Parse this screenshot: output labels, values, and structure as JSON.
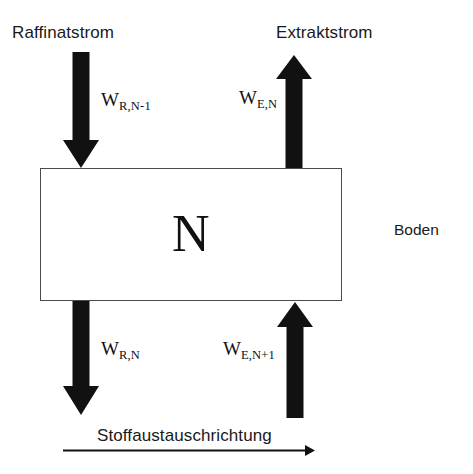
{
  "diagram": {
    "title_top_left": "Raffinatstrom",
    "title_top_right": "Extraktstrom",
    "side_label": "Boden",
    "stage_label": "N",
    "bottom_caption": "Stoffaustauschrichtung",
    "flux_labels": {
      "top_left": {
        "symbol": "W",
        "subscript": "R,N-1"
      },
      "top_right": {
        "symbol": "W",
        "subscript": "E,N"
      },
      "bottom_left": {
        "symbol": "W",
        "subscript": "R,N"
      },
      "bottom_right": {
        "symbol": "W",
        "subscript": "E,N+1"
      }
    },
    "colors": {
      "arrow_fill": "#111111",
      "box_stroke": "#4a4a4a",
      "text": "#1a1a1a",
      "background": "#ffffff"
    },
    "arrows": [
      {
        "name": "raffinat-in",
        "direction": "down",
        "position": "top-left"
      },
      {
        "name": "extrakt-out",
        "direction": "up",
        "position": "top-right"
      },
      {
        "name": "raffinat-out",
        "direction": "down",
        "position": "bottom-left"
      },
      {
        "name": "extrakt-in",
        "direction": "up",
        "position": "bottom-right"
      },
      {
        "name": "mass-transfer-direction",
        "direction": "right",
        "position": "bottom"
      }
    ]
  }
}
